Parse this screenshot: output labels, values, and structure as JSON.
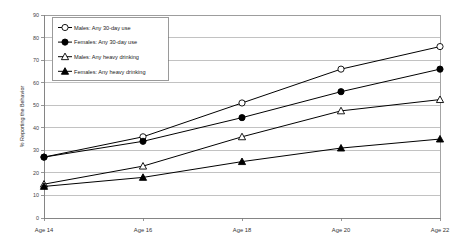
{
  "chart_data": {
    "type": "line",
    "title": "",
    "xlabel": "",
    "ylabel": "% Reporting the Behavior",
    "categories": [
      "Age 14",
      "Age 16",
      "Age 18",
      "Age 20",
      "Age 22"
    ],
    "ylim": [
      0,
      90
    ],
    "ytick_step": 10,
    "yticks": [
      0,
      10,
      20,
      30,
      40,
      50,
      60,
      70,
      80,
      90
    ],
    "ytick_labels": [
      "0",
      "10",
      "20",
      "30",
      "40",
      "50",
      "60",
      "70",
      "80",
      "90"
    ],
    "grid": true,
    "grid_axis": "y",
    "legend_position": "top-left-inside",
    "series": [
      {
        "name": "Males: Any 30-day use",
        "marker": "open-circle",
        "values": [
          27,
          36,
          51,
          66,
          76
        ]
      },
      {
        "name": "Females: Any 30-day use",
        "marker": "filled-circle",
        "values": [
          27,
          34,
          44.5,
          56,
          66
        ]
      },
      {
        "name": "Males: Any heavy drinking",
        "marker": "open-triangle",
        "values": [
          15,
          23,
          36,
          47.5,
          52.5
        ]
      },
      {
        "name": "Females: Any heavy drinking",
        "marker": "filled-triangle",
        "values": [
          14,
          18,
          25,
          31,
          35
        ]
      }
    ],
    "colors": {
      "line": "#000000",
      "grid": "#9a9a9a",
      "frame": "#8d8d8d",
      "background": "#ffffff",
      "text": "#333333"
    }
  }
}
